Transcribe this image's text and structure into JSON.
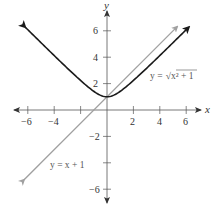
{
  "chart_data": {
    "type": "line",
    "title": "",
    "xlabel": "x",
    "ylabel": "y",
    "xlim": [
      -7,
      7
    ],
    "ylim": [
      -7,
      7
    ],
    "grid": false,
    "x_ticks": [
      -6,
      -4,
      -2,
      2,
      4,
      6
    ],
    "x_tick_labels": [
      "-6",
      "-4",
      "",
      "2",
      "4",
      "6"
    ],
    "y_ticks": [
      -6,
      -4,
      -2,
      2,
      4,
      6
    ],
    "y_tick_labels": [
      "-6",
      "",
      "-2",
      "2",
      "4",
      "6"
    ],
    "series": [
      {
        "name": "y = √(x² + 1)",
        "label": "y = √x² + 1",
        "color": "#1a1a1a",
        "style": "solid",
        "arrows": "both",
        "x": [
          -6.2,
          -5,
          -4,
          -3,
          -2,
          -1,
          -0.5,
          0,
          0.5,
          1,
          2,
          3,
          4,
          5,
          6.2
        ],
        "y": [
          6.28,
          5.1,
          4.12,
          3.16,
          2.24,
          1.41,
          1.12,
          1.0,
          1.12,
          1.41,
          2.24,
          3.16,
          4.12,
          5.1,
          6.28
        ]
      },
      {
        "name": "y = x + 1",
        "label": "y = x + 1",
        "color": "#a0a0a0",
        "style": "solid",
        "arrows": "both",
        "x": [
          -6.3,
          5.3
        ],
        "y": [
          -5.3,
          6.3
        ]
      }
    ],
    "annotations": [
      {
        "text": "y = √x² + 1",
        "x": 4.5,
        "y": 3.0
      },
      {
        "text": "y = x + 1",
        "x": -2.9,
        "y": -4.0
      }
    ]
  },
  "labels": {
    "x_axis": "x",
    "y_axis": "y",
    "curve_eq_prefix": "y = ",
    "curve_eq_radicand": "x² + 1",
    "line_eq": "y = x + 1",
    "xt": [
      "−6",
      "−4",
      "2",
      "4",
      "6"
    ],
    "yt": [
      "6",
      "4",
      "2",
      "−2",
      "−6"
    ]
  }
}
